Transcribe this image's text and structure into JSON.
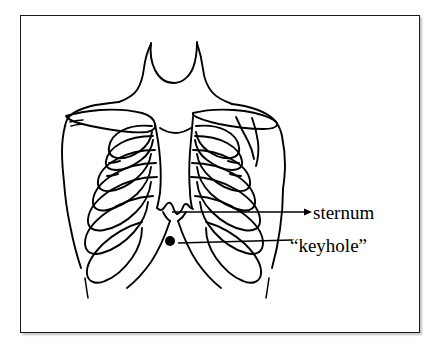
{
  "figure": {
    "kind": "anatomical-line-drawing",
    "border_color": "#1a1a1a",
    "ink_color": "#000000",
    "background_color": "#ffffff"
  },
  "callouts": [
    {
      "id": "sternum",
      "label": "sternum",
      "leader": "horizontal line with arrowhead pointing right to label",
      "target": "lower sternum / xiphoid process"
    },
    {
      "id": "keyhole",
      "label": "“keyhole”",
      "leader": "line from filled dot rising slightly to the right",
      "target": "filled dot below the xiphoid process"
    }
  ],
  "markers": {
    "keyhole_dot": "filled black circle"
  },
  "icons": {
    "arrowhead": "arrow-right-icon",
    "dot": "filled-dot-icon"
  }
}
